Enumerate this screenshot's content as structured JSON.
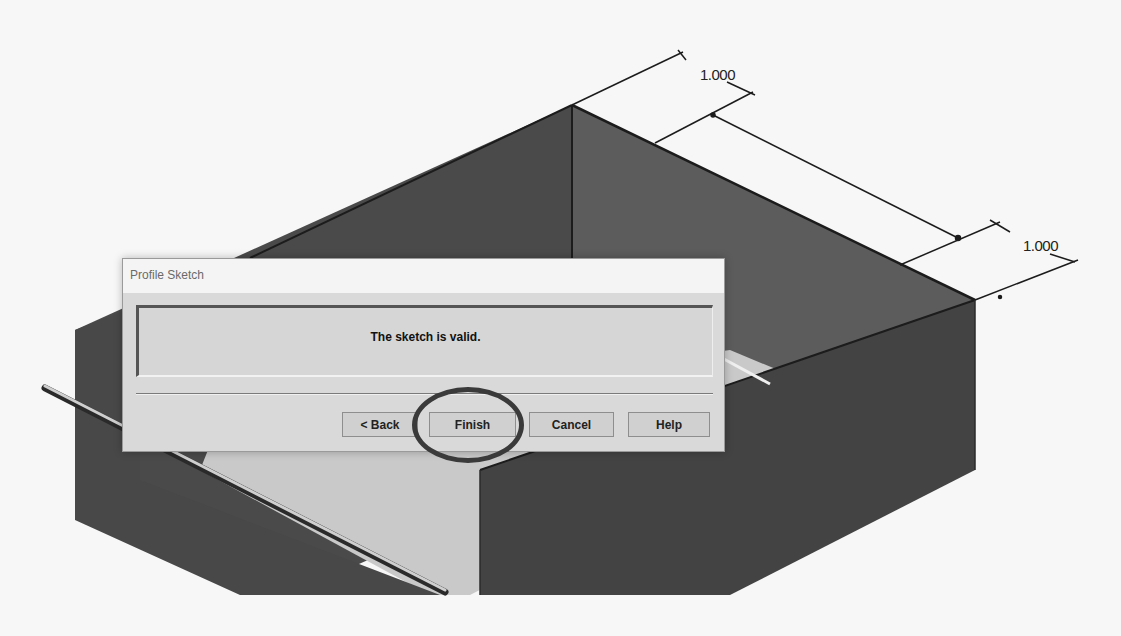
{
  "viewport": {
    "background_color": "#f7f7f7",
    "model_colors": {
      "back_wall_left": "#4a4a4a",
      "back_wall_right": "#5c5c5c",
      "front_wall": "#434343",
      "floor": "#c9c9c9",
      "rod": "#bdbdbd"
    },
    "dimensions": [
      {
        "id": "dim-top",
        "value": "1.000"
      },
      {
        "id": "dim-right",
        "value": "1.000"
      }
    ]
  },
  "dialog": {
    "title": "Profile Sketch",
    "message": "The sketch is valid.",
    "buttons": {
      "back": "< Back",
      "finish": "Finish",
      "cancel": "Cancel",
      "help": "Help"
    },
    "highlighted_button": "finish",
    "highlight_color": "#3a3a3a"
  }
}
